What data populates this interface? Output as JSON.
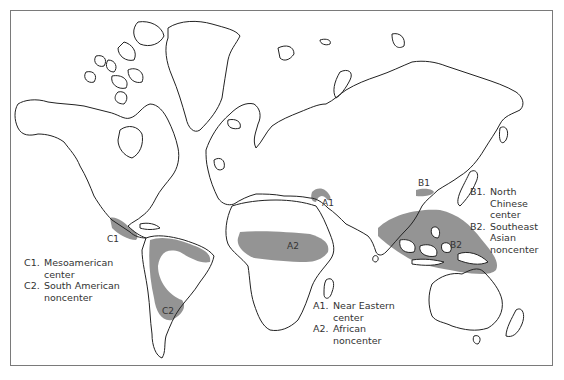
{
  "map": {
    "type": "world outline map",
    "shading_color": "#8e8e8e",
    "regions": [
      {
        "code": "A1",
        "name": "Near Eastern",
        "type": "center"
      },
      {
        "code": "A2",
        "name": "African",
        "type": "noncenter"
      },
      {
        "code": "B1",
        "name": "North Chinese",
        "type": "center"
      },
      {
        "code": "B2",
        "name": "Southeast Asian",
        "type": "noncenter"
      },
      {
        "code": "C1",
        "name": "Mesoamerican",
        "type": "center"
      },
      {
        "code": "C2",
        "name": "South American",
        "type": "noncenter"
      }
    ],
    "map_labels": {
      "a1": "A1",
      "a2": "A2",
      "b1": "B1",
      "b2": "B2",
      "c1": "C1",
      "c2": "C2"
    }
  },
  "legends": {
    "americas": [
      {
        "code": "C1.",
        "line1": "Mesoamerican",
        "line2": "center"
      },
      {
        "code": "C2.",
        "line1": "South American",
        "line2": "noncenter"
      }
    ],
    "africa": [
      {
        "code": "A1.",
        "line1": "Near Eastern",
        "line2": "center"
      },
      {
        "code": "A2.",
        "line1": "African",
        "line2": "noncenter"
      }
    ],
    "asia": [
      {
        "code": "B1.",
        "line1": "North",
        "line2": "Chinese",
        "line3": "center"
      },
      {
        "code": "B2.",
        "line1": "Southeast",
        "line2": "Asian",
        "line3": "noncenter"
      }
    ]
  }
}
